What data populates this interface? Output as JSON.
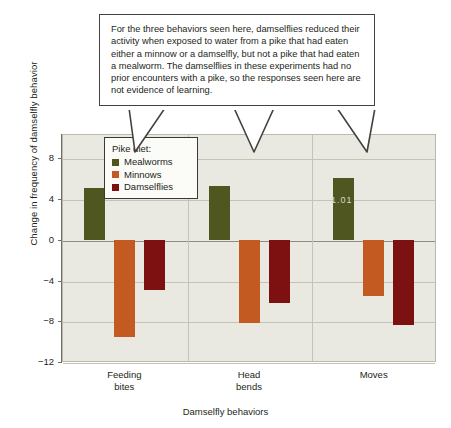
{
  "chart_data": {
    "type": "bar",
    "title": "",
    "xlabel": "Damselfly behaviors",
    "ylabel": "Change in frequency of damselfly behavior",
    "categories": [
      "Feeding bites",
      "Head bends",
      "Moves"
    ],
    "category_lines": [
      [
        "Feeding",
        "bites"
      ],
      [
        "Head",
        "bends"
      ],
      [
        "Moves"
      ]
    ],
    "series": [
      {
        "name": "Mealworms",
        "color": "#4f5620",
        "values": [
          5.1,
          5.3,
          6.1
        ]
      },
      {
        "name": "Minnows",
        "color": "#c25a22",
        "values": [
          -9.5,
          -8.2,
          -5.5
        ]
      },
      {
        "name": "Damselflies",
        "color": "#7d1111",
        "values": [
          -4.9,
          -6.2,
          -8.4
        ]
      }
    ],
    "ylim": [
      -12,
      10.4
    ],
    "yticks": [
      8,
      4,
      0,
      -4,
      -8,
      -12
    ],
    "ytick_labels": [
      "8",
      "4",
      "0",
      "−4",
      "−8",
      "−12"
    ],
    "grid": true,
    "legend_position": "inside-top-left",
    "watermark": "1.01"
  },
  "legend": {
    "title": "Pike diet:",
    "entries": [
      {
        "label": "Mealworms",
        "color": "#4f5620"
      },
      {
        "label": "Minnows",
        "color": "#c25a22"
      },
      {
        "label": "Damselflies",
        "color": "#7d1111"
      }
    ]
  },
  "callout": {
    "text": "For the three behaviors seen here, damselflies reduced their activity when exposed to water from a pike that had eaten either a minnow or a damselfly, but not a pike that had eaten a mealworm. The damselflies in these experiments had no prior encounters with a pike, so the responses seen here are not evidence of learning."
  },
  "colors": {
    "plot_background": "#e9e9e2",
    "gridline": "#c3c3b8",
    "axis": "#6f6f66",
    "text": "#231f20",
    "callout_border": "#45423d"
  }
}
